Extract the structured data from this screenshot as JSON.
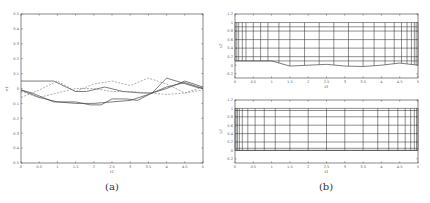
{
  "captions": {
    "a": "(a)",
    "b": "(b)"
  },
  "chart_data": [
    {
      "id": "a",
      "type": "line",
      "title": "",
      "xlabel": "t1",
      "ylabel": "e1",
      "xlim": [
        0,
        5
      ],
      "ylim": [
        -0.5,
        0.5
      ],
      "xticks": [
        "0",
        "0.5",
        "1",
        "1.5",
        "2",
        "2.5",
        "3",
        "3.5",
        "4",
        "4.5",
        "5"
      ],
      "yticks": [
        "-0.5",
        "-0.4",
        "-0.3",
        "-0.2",
        "-0.1",
        "0",
        "0.1",
        "0.2",
        "0.3",
        "0.4",
        "0.5"
      ],
      "grid": false,
      "series": [
        {
          "name": "solid-1",
          "style": "solid",
          "x": [
            0,
            0.5,
            0.9,
            1.5,
            1.8,
            2.3,
            2.8,
            3.3,
            3.6,
            4.0,
            4.5,
            5.0
          ],
          "y": [
            0.05,
            0.05,
            0.05,
            -0.02,
            -0.02,
            0.01,
            -0.02,
            -0.03,
            -0.03,
            0.0,
            0.05,
            0.01
          ]
        },
        {
          "name": "solid-2",
          "style": "solid",
          "x": [
            0,
            0.3,
            0.9,
            1.5,
            1.9,
            2.2,
            2.5,
            2.9,
            3.2,
            3.6,
            4.0,
            4.4,
            4.8,
            5.0
          ],
          "y": [
            -0.01,
            -0.03,
            -0.09,
            -0.09,
            -0.11,
            -0.11,
            -0.07,
            -0.07,
            -0.08,
            -0.03,
            0.07,
            0.04,
            0.01,
            0.0
          ]
        },
        {
          "name": "solid-3",
          "style": "solid",
          "x": [
            0,
            0.5,
            1.0,
            1.5,
            2.0,
            2.5,
            3.0,
            3.5,
            4.0,
            4.5,
            5.0
          ],
          "y": [
            -0.01,
            -0.06,
            -0.09,
            -0.1,
            -0.1,
            -0.09,
            -0.08,
            -0.04,
            0.01,
            0.04,
            0.0
          ]
        },
        {
          "name": "dashed-1",
          "style": "dashed",
          "x": [
            0,
            0.5,
            1.0,
            1.5,
            2.0,
            2.5,
            3.0,
            3.5,
            4.0,
            4.5,
            5.0
          ],
          "y": [
            -0.06,
            -0.01,
            0.05,
            -0.02,
            0.03,
            0.05,
            0.02,
            0.07,
            0.03,
            -0.03,
            0.01
          ]
        },
        {
          "name": "dashed-2",
          "style": "dashed",
          "x": [
            0,
            0.5,
            1.0,
            1.5,
            2.0,
            2.5,
            3.0,
            3.5,
            4.0,
            4.5,
            5.0
          ],
          "y": [
            -0.02,
            -0.06,
            -0.03,
            0.0,
            0.0,
            -0.02,
            -0.02,
            -0.03,
            -0.04,
            -0.03,
            -0.01
          ]
        }
      ]
    },
    {
      "id": "b-top",
      "type": "line",
      "title": "",
      "xlabel": "t1",
      "ylabel": "x2",
      "xlim": [
        0,
        5
      ],
      "ylim": [
        -0.3,
        1.2
      ],
      "xticks": [
        "0",
        "0.5",
        "1",
        "1.5",
        "2",
        "2.5",
        "3",
        "3.5",
        "4",
        "4.5",
        "5"
      ],
      "yticks": [
        "-0.2",
        "0",
        "0.2",
        "0.4",
        "0.6",
        "0.8",
        "1",
        "1.2"
      ],
      "grid": false,
      "mesh": {
        "vertical_x": [
          0,
          0.05,
          0.1,
          0.2,
          0.3,
          0.5,
          0.7,
          0.9,
          1.2,
          1.5,
          1.9,
          2.3,
          2.7,
          3.1,
          3.5,
          3.8,
          4.1,
          4.35,
          4.55,
          4.7,
          4.82,
          4.9,
          4.95,
          5.0
        ],
        "horizontal_y": [
          1.0,
          0.9,
          0.8,
          0.6,
          0.4,
          0.2,
          0.1
        ],
        "bottom_boundary": {
          "x": [
            0,
            1.0,
            1.5,
            2.0,
            2.5,
            3.0,
            3.5,
            4.0,
            4.5,
            5.0
          ],
          "y": [
            0.1,
            0.1,
            -0.02,
            0.0,
            0.02,
            -0.02,
            -0.03,
            0.0,
            0.05,
            0.0
          ]
        },
        "top_boundary": 1.0
      }
    },
    {
      "id": "b-bottom",
      "type": "line",
      "title": "",
      "xlabel": "t1",
      "ylabel": "x2",
      "xlim": [
        0,
        5
      ],
      "ylim": [
        -0.3,
        1.2
      ],
      "xticks": [
        "0",
        "0.5",
        "1",
        "1.5",
        "2",
        "2.5",
        "3",
        "3.5",
        "4",
        "4.5",
        "5"
      ],
      "yticks": [
        "-0.2",
        "0",
        "0.2",
        "0.4",
        "0.6",
        "0.8",
        "1",
        "1.2"
      ],
      "grid": false,
      "mesh": {
        "vertical_x": [
          0,
          0.03,
          0.07,
          0.12,
          0.2,
          0.35,
          0.55,
          0.8,
          1.1,
          1.5,
          2.0,
          2.5,
          3.0,
          3.5,
          3.9,
          4.2,
          4.45,
          4.65,
          4.8,
          4.9,
          4.96,
          5.0
        ],
        "horizontal_y": [
          1.0,
          0.95,
          0.8,
          0.6,
          0.4,
          0.2,
          0.05,
          0.0
        ],
        "bottom_boundary": {
          "x": [
            0,
            5
          ],
          "y": [
            0,
            0
          ]
        },
        "top_boundary": 1.0
      }
    }
  ]
}
